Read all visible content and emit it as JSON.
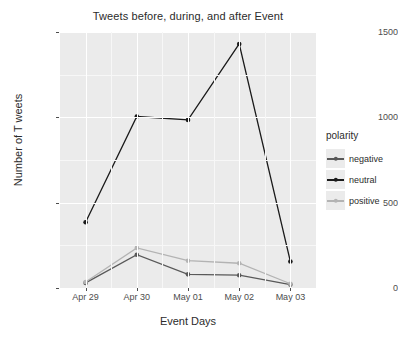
{
  "chart_data": {
    "type": "line",
    "title": "Tweets before, during, and after Event",
    "xlabel": "Event Days",
    "ylabel": "Number of T weets",
    "categories": [
      "Apr 29",
      "Apr 30",
      "May 01",
      "May 02",
      "May 03"
    ],
    "series": [
      {
        "name": "negative",
        "color": "#595959",
        "values": [
          30,
          195,
          80,
          75,
          20
        ]
      },
      {
        "name": "neutral",
        "color": "#1a1a1a",
        "values": [
          385,
          1005,
          985,
          1430,
          155
        ]
      },
      {
        "name": "positive",
        "color": "#b3b3b3",
        "values": [
          35,
          235,
          160,
          145,
          25
        ]
      }
    ],
    "ylim": [
      0,
      1500
    ],
    "yticks": [
      0,
      500,
      1000,
      1500
    ],
    "ytick_labels": [
      "0",
      "500",
      "1000",
      "1500"
    ],
    "grid": true,
    "legend_position": "right",
    "legend_title": "polarity",
    "panel_background": "#ebebeb",
    "gridline_color": "#ffffff"
  },
  "legend": {
    "title": "polarity",
    "items": [
      {
        "label": "negative",
        "color": "#595959"
      },
      {
        "label": "neutral",
        "color": "#1a1a1a"
      },
      {
        "label": "positive",
        "color": "#b3b3b3"
      }
    ]
  }
}
